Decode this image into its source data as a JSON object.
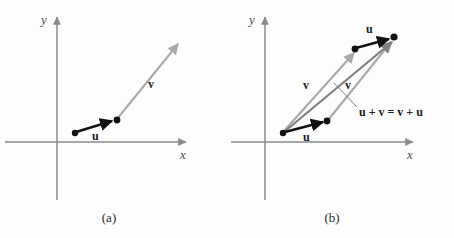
{
  "figure": {
    "background_color": "#fdfdfd"
  },
  "colors": {
    "axis": "#8a8a8a",
    "vector_u": "#111111",
    "vector_v": "#a8a8a8",
    "vector_sum": "#808080",
    "leader_line": "#707070",
    "label_text": "#1a1a1a",
    "axis_label_text": "#4a4a4a"
  },
  "panels": [
    {
      "id": "a",
      "caption": "(a)",
      "axes": {
        "x_label": "x",
        "y_label": "y"
      },
      "vectors": [
        {
          "name": "u",
          "label": "u",
          "style": "solid-dark",
          "from": [
            75,
            133
          ],
          "to": [
            116,
            120
          ]
        },
        {
          "name": "v",
          "label": "v",
          "style": "solid-gray",
          "from": [
            117,
            120
          ],
          "to": [
            181,
            41
          ]
        }
      ],
      "labels": [
        {
          "name": "u-label",
          "text": "u",
          "x": 92,
          "y": 130
        },
        {
          "name": "v-label",
          "text": "v",
          "x": 148,
          "y": 78
        }
      ],
      "points": [
        [
          75,
          133
        ],
        [
          117,
          120
        ]
      ]
    },
    {
      "id": "b",
      "caption": "(b)",
      "axes": {
        "x_label": "x",
        "y_label": "y"
      },
      "vectors": [
        {
          "name": "u-bottom",
          "label": "u",
          "style": "solid-dark",
          "from": [
            58,
            133
          ],
          "to": [
            99,
            121
          ]
        },
        {
          "name": "v-left",
          "label": "v",
          "style": "solid-gray",
          "from": [
            56,
            132
          ],
          "to": [
            130,
            50
          ]
        },
        {
          "name": "u-top",
          "label": "u",
          "style": "solid-dark",
          "from": [
            128,
            48
          ],
          "to": [
            166,
            37
          ]
        },
        {
          "name": "v-right",
          "label": "v",
          "style": "solid-gray",
          "from": [
            101,
            120
          ],
          "to": [
            167,
            38
          ]
        },
        {
          "name": "u-plus-v",
          "label": "u + v = v + u",
          "style": "solid-sum",
          "from": [
            56,
            133
          ],
          "to": [
            168,
            38
          ]
        }
      ],
      "labels": [
        {
          "name": "u-bottom-label",
          "text": "u",
          "x": 76,
          "y": 131
        },
        {
          "name": "v-left-label",
          "text": "v",
          "x": 76,
          "y": 79
        },
        {
          "name": "u-top-label",
          "text": "u",
          "x": 139,
          "y": 23
        },
        {
          "name": "v-right-label",
          "text": "v",
          "x": 118,
          "y": 79
        },
        {
          "name": "sum-label",
          "text": "u + v = v + u",
          "x": 132,
          "y": 108
        }
      ],
      "points": [
        [
          56,
          133
        ],
        [
          100,
          120
        ],
        [
          128,
          48
        ],
        [
          167,
          37
        ]
      ],
      "leader_line": {
        "from": [
          131,
          109
        ],
        "to": [
          108,
          84
        ]
      }
    }
  ]
}
